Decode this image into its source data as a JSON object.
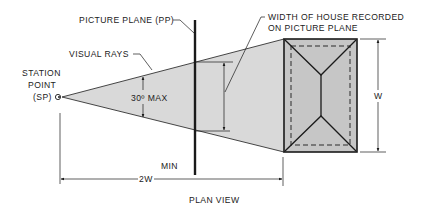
{
  "colors": {
    "ink": "#1a1a1a",
    "cone_fill": "#d9d9d9",
    "house_fill": "#c6c6c6",
    "background": "#ffffff"
  },
  "labels": {
    "picture_plane": "PICTURE PLANE (PP)",
    "visual_rays": "VISUAL RAYS",
    "station_point_line1": "STATION",
    "station_point_line2": "POINT",
    "station_point_line3": "(SP)",
    "angle": "30º MAX",
    "width_recorded_line1": "WIDTH OF HOUSE RECORDED",
    "width_recorded_line2": "ON PICTURE PLANE",
    "house_width": "W",
    "min": "MIN",
    "distance": "2W",
    "caption": "PLAN VIEW"
  },
  "icons": {
    "station_point": "eye-icon"
  }
}
